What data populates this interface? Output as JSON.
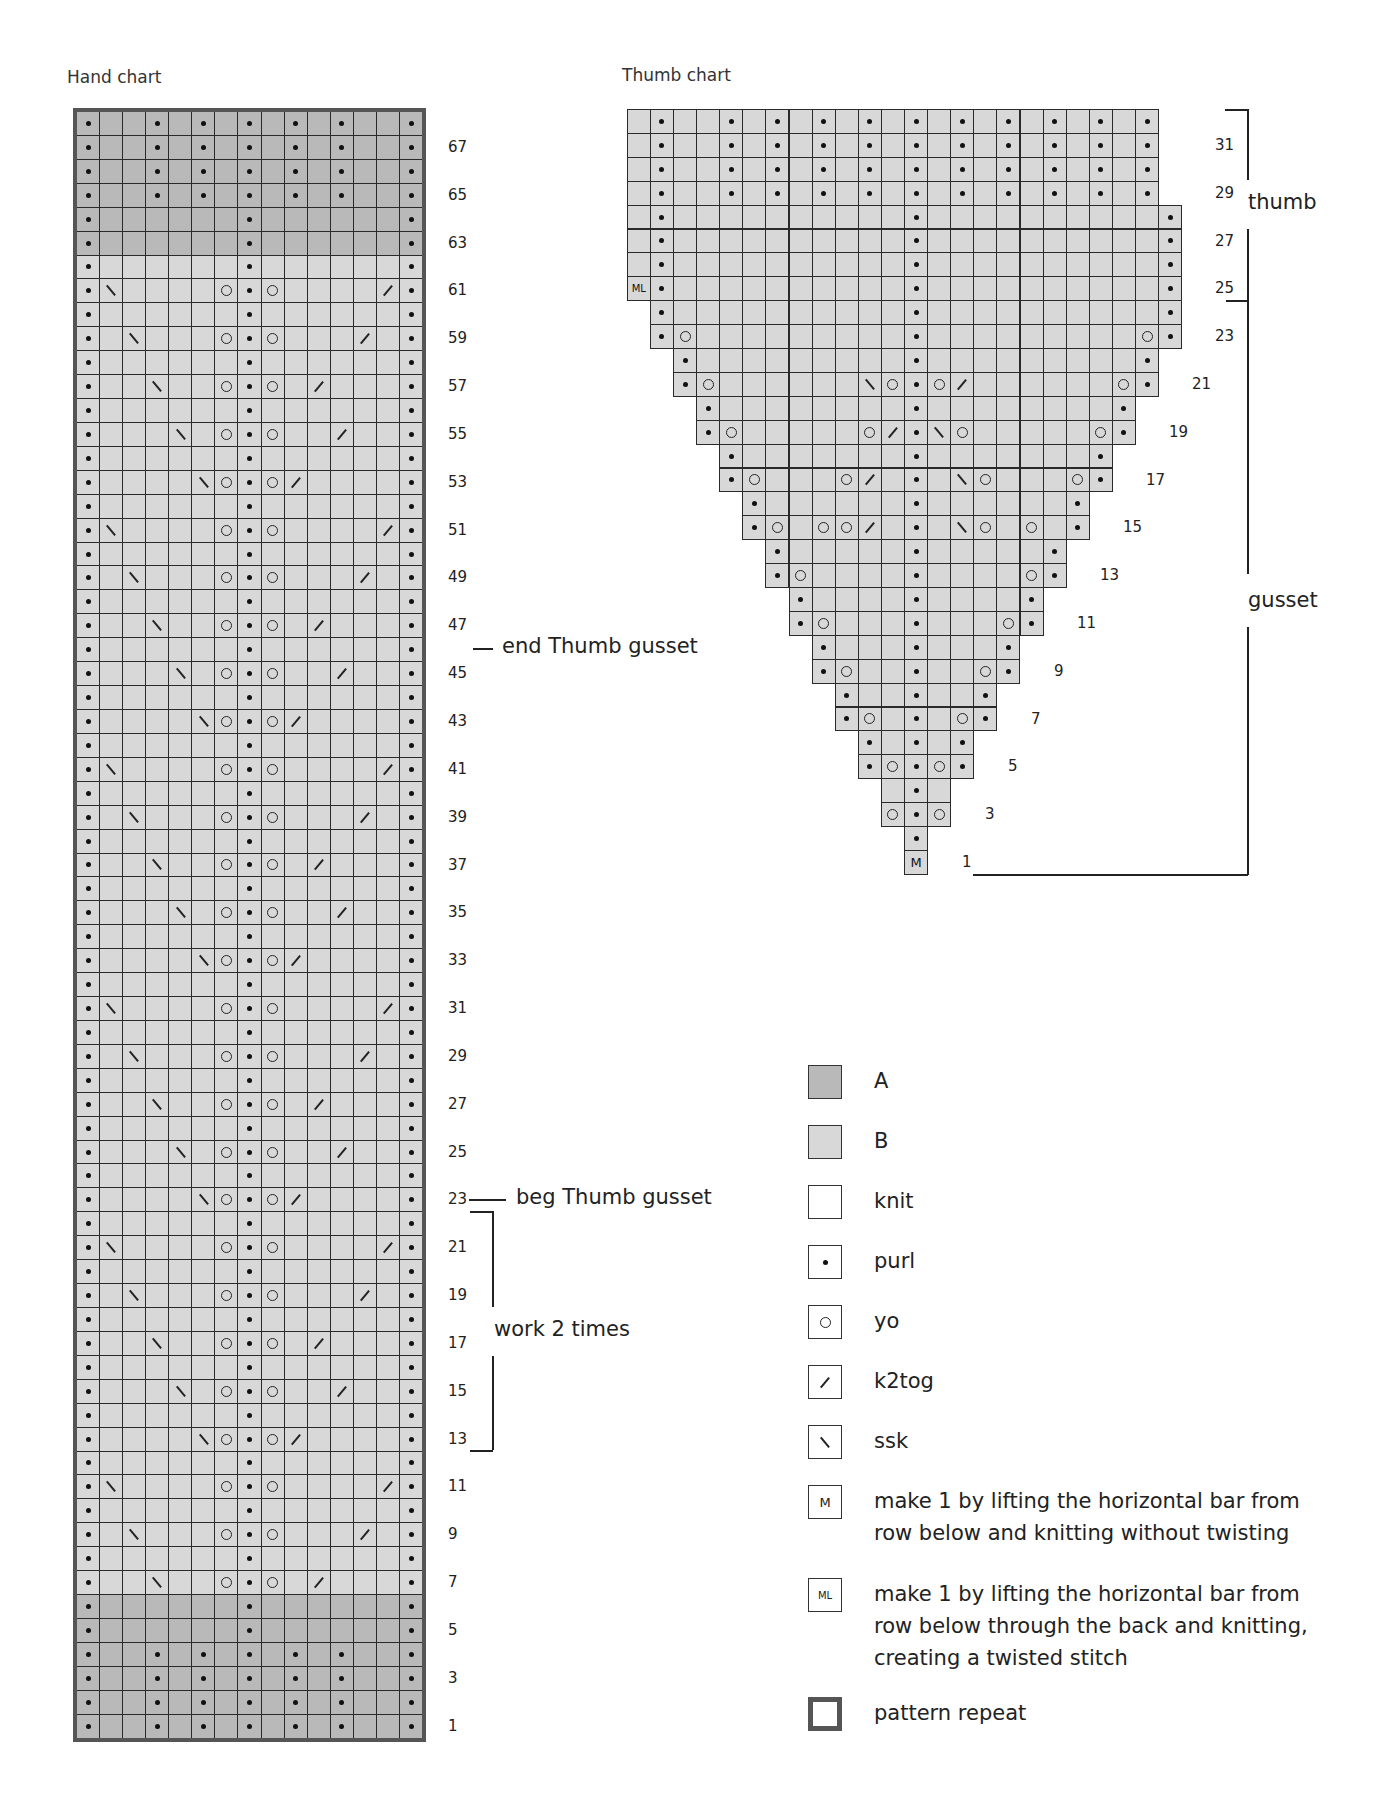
{
  "colors": {
    "A": "#b9b9b9",
    "B": "#d8d8d8",
    "knit": "#ffffff",
    "grid": "#2a2a2a",
    "repeat_border": "#555555"
  },
  "hand_chart": {
    "title": "Hand chart",
    "columns": 15,
    "rows_count": 68,
    "row_labels": [
      "1",
      "3",
      "5",
      "7",
      "9",
      "11",
      "13",
      "15",
      "17",
      "19",
      "21",
      "23",
      "25",
      "27",
      "29",
      "31",
      "33",
      "35",
      "37",
      "39",
      "41",
      "43",
      "45",
      "47",
      "49",
      "51",
      "53",
      "55",
      "57",
      "59",
      "61",
      "63",
      "65",
      "67"
    ],
    "color_A_rows": [
      1,
      2,
      3,
      4,
      5,
      6,
      63,
      64,
      65,
      66,
      67,
      68
    ],
    "rows": {
      "1": ".kk.k.k.k.k.kk.",
      "2": ".kk.k.k.k.k.kk.",
      "3": ".kk.k.k.k.k.kk.",
      "4": ".kk.k.k.k.k.kk.",
      "5": ".kkkkkk.kkkkkk.",
      "6": ".kkkkkk.kkkkkk.",
      "odd_cycle": [
        ".kk\\kko.ok/kkk.",
        ".k\\kkko.okkk/k.",
        ".\\kkkko.okkkk/.",
        ".kkkk\\o.o/kkkk.",
        ".kkk\\ko.okk/kk."
      ],
      "odd_cycle_start_row": 7,
      "even_body": ".kkkkkk.kkkkkk.",
      "63": ".kkkkkk.kkkkkk.",
      "64": ".kkkkkk.kkkkkk.",
      "65": ".kk.k.k.k.k.kk.",
      "66": ".kk.k.k.k.k.kk.",
      "67": ".kk.k.k.k.k.kk.",
      "68": ".kk.k.k.k.k.kk."
    },
    "annotations": {
      "end_gusset": "end Thumb gusset",
      "beg_gusset": "beg Thumb gusset",
      "work_times": "work 2 times"
    }
  },
  "thumb_chart": {
    "title": "Thumb chart",
    "rows_count": 32,
    "center_col": 10,
    "row_labels": [
      "1",
      "3",
      "5",
      "7",
      "9",
      "11",
      "13",
      "15",
      "17",
      "19",
      "21",
      "23",
      "25",
      "27",
      "29",
      "31"
    ],
    "rows": [
      {
        "row": 1,
        "start": 10,
        "cells": "M"
      },
      {
        "row": 2,
        "start": 10,
        "cells": "."
      },
      {
        "row": 3,
        "start": 9,
        "cells": "o.o"
      },
      {
        "row": 4,
        "start": 9,
        "cells": "k.k"
      },
      {
        "row": 5,
        "start": 8,
        "cells": ".o.o."
      },
      {
        "row": 6,
        "start": 8,
        "cells": ".k.k."
      },
      {
        "row": 7,
        "start": 7,
        "cells": ".ok.ko."
      },
      {
        "row": 8,
        "start": 7,
        "cells": ".kk.kk."
      },
      {
        "row": 9,
        "start": 6,
        "cells": ".okk.kko."
      },
      {
        "row": 10,
        "start": 6,
        "cells": ".kkk.kkk."
      },
      {
        "row": 11,
        "start": 5,
        "cells": ".okkk.kkko."
      },
      {
        "row": 12,
        "start": 5,
        "cells": ".kkkk.kkkk."
      },
      {
        "row": 13,
        "start": 4,
        "cells": ".okkkk.kkkko."
      },
      {
        "row": 14,
        "start": 4,
        "cells": ".kkkkk.kkkkk."
      },
      {
        "row": 15,
        "start": 3,
        "cells": ".okoo/k.k\\okok."
      },
      {
        "row": 16,
        "start": 3,
        "cells": ".kkkkkk.kkkkkk."
      },
      {
        "row": 17,
        "start": 2,
        "cells": ".okkko/k.k\\okkko."
      },
      {
        "row": 18,
        "start": 2,
        "cells": ".kkkkkkk.kkkkkkk."
      },
      {
        "row": 19,
        "start": 1,
        "cells": ".okkkkko/.\\okkkkko."
      },
      {
        "row": 20,
        "start": 1,
        "cells": ".kkkkkkkk.kkkkkkkk."
      },
      {
        "row": 21,
        "start": 0,
        "cells": ".okkkkkk\\o.o/kkkkkko."
      },
      {
        "row": 22,
        "start": 0,
        "cells": ".kkkkkkkkk.kkkkkkkkk."
      },
      {
        "row": 23,
        "start": -1,
        "cells": ".okkkkkkkkk.kkkkkkkkko."
      },
      {
        "row": 24,
        "start": -1,
        "cells": ".kkkkkkkkkk.kkkkkkkkkk."
      },
      {
        "row": 25,
        "start": -2,
        "cells": "L.kkkkkkkkkk.kkkkkkkkkk."
      },
      {
        "row": 26,
        "start": -2,
        "cells": "k.kkkkkkkkkk.kkkkkkkkkk."
      },
      {
        "row": 27,
        "start": -2,
        "cells": "k.kkkkkkkkkk.kkkkkkkkkk."
      },
      {
        "row": 28,
        "start": -2,
        "cells": "k.kkkkkkkkkk.kkkkkkkkkk."
      },
      {
        "row": 29,
        "start": -2,
        "cells": "k.kk.k.k.k.k.k.k.k.k.k."
      },
      {
        "row": 30,
        "start": -2,
        "cells": "k.kk.k.k.k.k.k.k.k.k.k."
      },
      {
        "row": 31,
        "start": -2,
        "cells": "k.kk.k.k.k.k.k.k.k.k.k."
      },
      {
        "row": 32,
        "start": -2,
        "cells": "k.kk.k.k.k.k.k.k.k.k.k."
      }
    ],
    "brackets": {
      "thumb": "thumb",
      "gusset": "gusset"
    }
  },
  "legend": {
    "items": [
      {
        "key": "A",
        "label": "A",
        "swatch": "A"
      },
      {
        "key": "B",
        "label": "B",
        "swatch": "B"
      },
      {
        "key": "knit",
        "label": "knit",
        "swatch": "knit"
      },
      {
        "key": "purl",
        "label": "purl",
        "swatch": "purl"
      },
      {
        "key": "yo",
        "label": "yo",
        "swatch": "yo"
      },
      {
        "key": "k2tog",
        "label": "k2tog",
        "swatch": "k2tog"
      },
      {
        "key": "ssk",
        "label": "ssk",
        "swatch": "ssk"
      },
      {
        "key": "M",
        "label": "make 1 by lifting the horizontal bar from row below and knitting without twisting",
        "swatch": "M"
      },
      {
        "key": "ML",
        "label": "make 1 by lifting the horizontal bar from row below through the back and knitting, creating a twisted stitch",
        "swatch": "ML"
      },
      {
        "key": "repeat",
        "label": "pattern repeat",
        "swatch": "repeat"
      }
    ]
  }
}
